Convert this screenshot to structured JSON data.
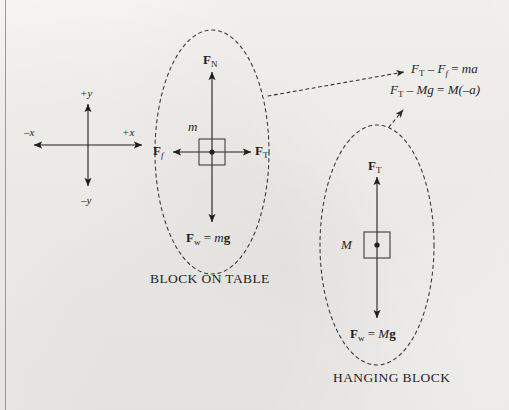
{
  "page": {
    "background_color": "#f3f1ee",
    "ink_color": "#1f1f1f",
    "left_rule_color": "#9a9a9a"
  },
  "axes": {
    "name": "coordinate-axes",
    "center": {
      "x": 88,
      "y": 145
    },
    "labels": {
      "plus_y": "+y",
      "minus_x": "–x",
      "plus_x": "+x",
      "minus_y": "–y"
    }
  },
  "diagrams": [
    {
      "id": "block-on-table",
      "caption": "BLOCK ON TABLE",
      "mass_label": "m",
      "forces": [
        {
          "id": "normal",
          "vector": "F",
          "subscript": "N",
          "direction": "up",
          "label_text": "F_N"
        },
        {
          "id": "friction",
          "vector": "F",
          "subscript": "f",
          "direction": "left",
          "label_text": "F_f"
        },
        {
          "id": "tension",
          "vector": "F",
          "subscript": "T",
          "direction": "right",
          "label_text": "F_T"
        },
        {
          "id": "weight",
          "vector": "F",
          "subscript": "w",
          "direction": "down",
          "label_text": "F_w = mg",
          "expression": "mg"
        }
      ]
    },
    {
      "id": "hanging-block",
      "caption": "HANGING BLOCK",
      "mass_label": "M",
      "forces": [
        {
          "id": "tension",
          "vector": "F",
          "subscript": "T",
          "direction": "up",
          "label_text": "F_T"
        },
        {
          "id": "weight",
          "vector": "F",
          "subscript": "w",
          "direction": "down",
          "label_text": "F_w = Mg",
          "expression": "Mg"
        }
      ]
    }
  ],
  "equations": [
    {
      "id": "block-on-table-equation",
      "lhs_force": "F",
      "lhs_sub": "T",
      "minus": "–",
      "term2_force": "F",
      "term2_sub": "f",
      "equals": "=",
      "rhs": "ma",
      "plain": "F_T – F_f = ma"
    },
    {
      "id": "hanging-block-equation",
      "lhs_force": "F",
      "lhs_sub": "T",
      "minus": "–",
      "term2": "Mg",
      "equals": "=",
      "rhs": "M(–a)",
      "plain": "F_T – Mg = M(–a)"
    }
  ]
}
